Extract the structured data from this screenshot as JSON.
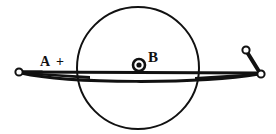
{
  "figure": {
    "background_color": "#ffffff",
    "stroke_color": "#111111",
    "labels": {
      "terminal_a": "A",
      "polarity_plus": "+",
      "field_b": "B"
    },
    "elements": {
      "field_region": {
        "name": "circular-field-region",
        "center_x": 138,
        "center_y": 68,
        "radius": 61,
        "stroke_width": 2
      },
      "field_symbol": {
        "name": "field-out-of-page-symbol",
        "center_x": 139,
        "center_y": 65,
        "outer_radius": 6,
        "inner_radius": 2.6
      },
      "left_terminal": {
        "name": "left-terminal-node",
        "center_x": 19,
        "center_y": 72,
        "radius": 3.6
      },
      "switch_pivot": {
        "name": "switch-pivot-node",
        "center_x": 261,
        "center_y": 74,
        "radius": 3.6
      },
      "switch_contact": {
        "name": "switch-open-contact-node",
        "center_x": 246,
        "center_y": 50,
        "radius": 3.6
      },
      "rod": {
        "name": "horizontal-conducting-rod",
        "left_x": 20,
        "right_x": 259,
        "top_y": 72,
        "bulge_y": 80
      }
    }
  }
}
